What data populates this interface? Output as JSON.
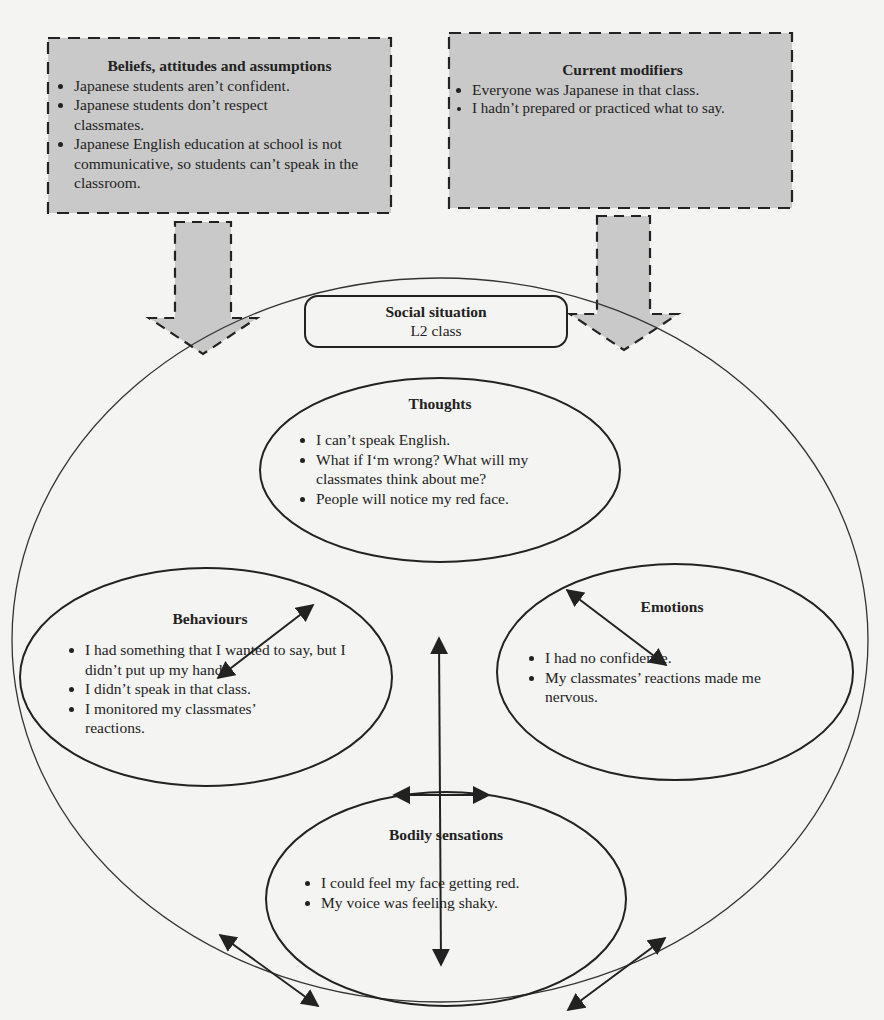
{
  "beliefs": {
    "title": "Beliefs, attitudes and assumptions",
    "items": [
      "Japanese students aren’t confident.",
      "Japanese students don’t respect classmates.",
      "Japanese English education at school is not communicative, so students can’t speak in the classroom."
    ]
  },
  "modifiers": {
    "title": "Current modifiers",
    "items": [
      "Everyone was Japanese in that class.",
      "I hadn’t prepared or practiced what to say."
    ]
  },
  "social_situation": {
    "title": "Social situation",
    "subtitle": "L2 class"
  },
  "thoughts": {
    "title": "Thoughts",
    "items": [
      "I can’t speak English.",
      "What if I‘m wrong? What will my classmates think about me?",
      "People will notice my red face."
    ]
  },
  "behaviours": {
    "title": "Behaviours",
    "items": [
      "I had something that I wanted to say, but I didn’t put up my hand.",
      "I didn’t speak in that class.",
      "I monitored my classmates’ reactions."
    ]
  },
  "emotions": {
    "title": "Emotions",
    "items": [
      "I had no confidence.",
      "My classmates’ reactions made me nervous."
    ]
  },
  "bodily": {
    "title": "Bodily sensations",
    "items": [
      "I could feel my face getting red.",
      "My voice was feeling shaky."
    ]
  },
  "colors": {
    "box_fill": "#c9c9c9",
    "line": "#222222",
    "background": "#f4f4f2"
  }
}
